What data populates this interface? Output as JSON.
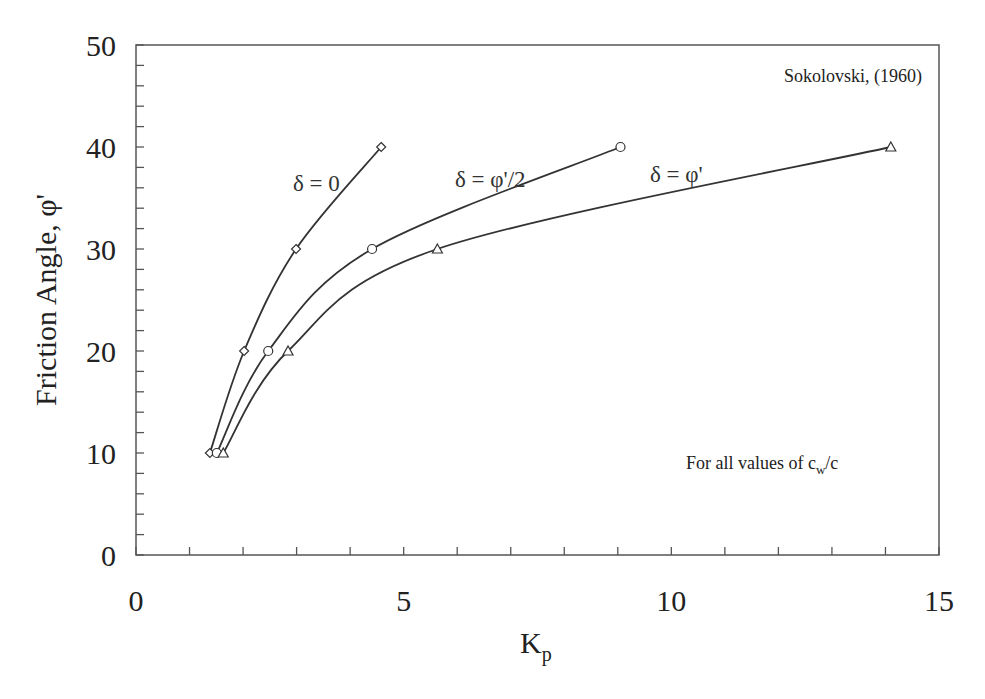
{
  "chart_data": {
    "type": "line",
    "title": "",
    "xlabel": "K",
    "xlabel_sub": "p",
    "ylabel": "Friction Angle, φ'",
    "xlim": [
      0,
      15
    ],
    "ylim": [
      0,
      50
    ],
    "x_ticks": [
      "0",
      "5",
      "10",
      "15"
    ],
    "y_ticks": [
      "0",
      "10",
      "20",
      "30",
      "40",
      "50"
    ],
    "x_minor_step": 1,
    "y_minor_step": 2,
    "grid": false,
    "legend_position": "inline labels on curves",
    "series": [
      {
        "name": "δ = 0",
        "marker": "diamond",
        "x": [
          1.38,
          2.02,
          2.99,
          4.58
        ],
        "y": [
          10,
          20,
          30,
          40
        ]
      },
      {
        "name": "δ = φ'/2",
        "marker": "circle",
        "x": [
          1.51,
          2.47,
          4.41,
          9.05
        ],
        "y": [
          10,
          20,
          30,
          40
        ]
      },
      {
        "name": "δ = φ'",
        "marker": "triangle",
        "x": [
          1.63,
          2.84,
          5.63,
          14.1
        ],
        "y": [
          10,
          20,
          30,
          40
        ]
      }
    ],
    "annotations": [
      "Sokolovski, (1960)",
      "For all values of c_w/c"
    ]
  },
  "labels": {
    "source": "Sokolovski, (1960)",
    "note_prefix": "For all values of c",
    "note_sub": "w",
    "note_suffix": "/c",
    "curve_delta0": "δ = 0",
    "curve_delta_half": "δ = φ'/2",
    "curve_delta_full": "δ = φ'",
    "ylabel": "Friction Angle, φ'",
    "xlabel_main": "K",
    "xlabel_sub": "p"
  },
  "colors": {
    "line": "#333333",
    "axis": "#555555",
    "text": "#222222"
  }
}
